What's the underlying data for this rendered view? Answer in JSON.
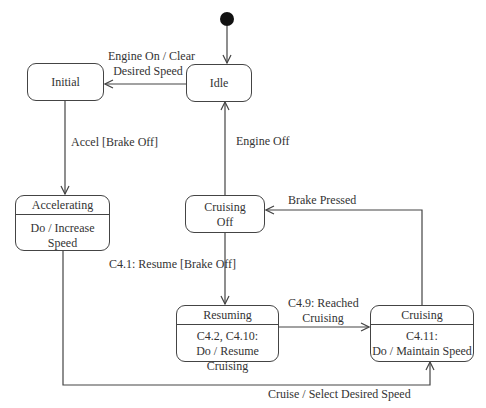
{
  "diagram": {
    "type": "uml-state-machine",
    "states": {
      "idle": {
        "name": "Idle"
      },
      "initial": {
        "name": "Initial"
      },
      "accelerating": {
        "name": "Accelerating",
        "activity": "Do / Increase Speed"
      },
      "cruising_off": {
        "name_line1": "Cruising",
        "name_line2": "Off"
      },
      "resuming": {
        "name": "Resuming",
        "activity_line1": "C4.2, C4.10:",
        "activity_line2": "Do / Resume Cruising"
      },
      "cruising": {
        "name": "Cruising",
        "activity_line1": "C4.11:",
        "activity_line2": "Do / Maintain Speed"
      }
    },
    "transitions": {
      "idle_to_initial": {
        "line1": "Engine On / Clear",
        "line2": "Desired Speed"
      },
      "initial_to_accelerating": {
        "label": "Accel [Brake Off]"
      },
      "cruising_off_to_idle": {
        "label": "Engine Off"
      },
      "cruising_to_cruising_off": {
        "label": "Brake Pressed"
      },
      "cruising_off_to_resuming": {
        "label": "C4.1: Resume [Brake Off]"
      },
      "resuming_to_cruising": {
        "line1": "C4.9: Reached",
        "line2": "Cruising"
      },
      "accelerating_to_cruising": {
        "label": "Cruise / Select Desired Speed"
      }
    },
    "colors": {
      "line": "#444444",
      "text": "#333333",
      "initial_node": "#111111"
    }
  }
}
